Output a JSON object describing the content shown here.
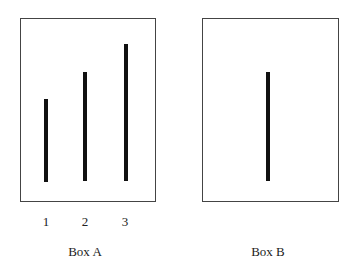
{
  "figure": {
    "box_a": {
      "caption": "Box A",
      "lines": [
        {
          "label": "1",
          "x": 46,
          "top": 99,
          "bottom": 182
        },
        {
          "label": "2",
          "x": 85,
          "top": 72,
          "bottom": 181
        },
        {
          "label": "3",
          "x": 126,
          "top": 44,
          "bottom": 181
        }
      ]
    },
    "box_b": {
      "caption": "Box B",
      "lines": [
        {
          "x": 268,
          "top": 72,
          "bottom": 181
        }
      ]
    }
  }
}
